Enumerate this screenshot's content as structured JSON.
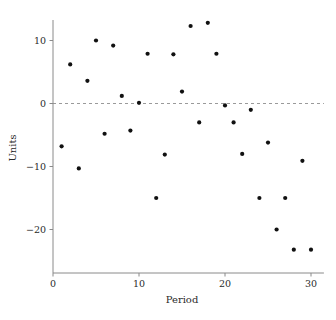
{
  "chart_data": {
    "type": "scatter",
    "title": "",
    "xlabel": "Period",
    "ylabel": "Units",
    "xlim": [
      0,
      31.5
    ],
    "ylim": [
      -24.5,
      14.5
    ],
    "xticks": [
      0,
      10,
      20,
      30
    ],
    "xtick_labels": [
      "0",
      "10",
      "20",
      "30"
    ],
    "yticks": [
      10,
      0,
      -10,
      -20
    ],
    "ytick_labels": [
      "10",
      "0",
      "−10",
      "−20"
    ],
    "grid": false,
    "legend": null,
    "annotations": [
      {
        "name": "zero-reference-line",
        "type": "hline",
        "y": 0,
        "style": "dashed",
        "color": "#9a9a9a"
      }
    ],
    "marker": {
      "shape": "circle",
      "color": "#111111",
      "size": 2.1
    },
    "x": [
      1,
      2,
      3,
      4,
      5,
      6,
      7,
      8,
      9,
      10,
      11,
      12,
      13,
      14,
      15,
      16,
      17,
      18,
      19,
      20,
      21,
      22,
      23,
      24,
      25,
      26,
      27,
      28,
      29,
      30
    ],
    "y": [
      -6.8,
      6.2,
      -10.3,
      3.6,
      10.0,
      -4.8,
      9.2,
      1.2,
      -4.3,
      0.1,
      7.9,
      -15.0,
      -8.1,
      7.8,
      1.9,
      12.3,
      -3.0,
      12.8,
      7.9,
      -0.3,
      -3.0,
      -8.0,
      -1.0,
      -15.0,
      -6.2,
      -20.0,
      -15.0,
      -23.2,
      -9.1,
      -23.2
    ],
    "points": [
      {
        "x": 1,
        "y": -6.8
      },
      {
        "x": 2,
        "y": 6.2
      },
      {
        "x": 3,
        "y": -10.3
      },
      {
        "x": 4,
        "y": 3.6
      },
      {
        "x": 5,
        "y": 10.0
      },
      {
        "x": 6,
        "y": -4.8
      },
      {
        "x": 7,
        "y": 9.2
      },
      {
        "x": 8,
        "y": 1.2
      },
      {
        "x": 9,
        "y": -4.3
      },
      {
        "x": 10,
        "y": 0.1
      },
      {
        "x": 11,
        "y": 7.9
      },
      {
        "x": 12,
        "y": -15.0
      },
      {
        "x": 13,
        "y": -8.1
      },
      {
        "x": 14,
        "y": 7.8
      },
      {
        "x": 15,
        "y": 1.9
      },
      {
        "x": 16,
        "y": 12.3
      },
      {
        "x": 17,
        "y": -3.0
      },
      {
        "x": 18,
        "y": 12.8
      },
      {
        "x": 19,
        "y": 7.9
      },
      {
        "x": 20,
        "y": -0.3
      },
      {
        "x": 21,
        "y": -3.0
      },
      {
        "x": 22,
        "y": -8.0
      },
      {
        "x": 23,
        "y": -1.0
      },
      {
        "x": 24,
        "y": -15.0
      },
      {
        "x": 25,
        "y": -6.2
      },
      {
        "x": 26,
        "y": -20.0
      },
      {
        "x": 27,
        "y": -15.0
      },
      {
        "x": 28,
        "y": -23.2
      },
      {
        "x": 29,
        "y": -9.1
      },
      {
        "x": 30,
        "y": -23.2
      }
    ]
  }
}
